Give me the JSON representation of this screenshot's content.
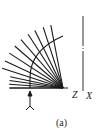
{
  "figure": {
    "caption": "(a)",
    "labels": {
      "z": "Z",
      "x": "X"
    },
    "fan": {
      "origin": [
        63,
        88
      ],
      "ray_count": 13,
      "radius": 58
    },
    "arc": {
      "radius": 33
    },
    "axis_line": {
      "x": 83,
      "y_top": 16,
      "y_bottom": 98
    },
    "arrow": {
      "x": 30,
      "y_top": 90,
      "y_bottom": 112,
      "direction": "up"
    },
    "colors": {
      "line": "#1a1a1a",
      "background": "#ffffff"
    }
  }
}
